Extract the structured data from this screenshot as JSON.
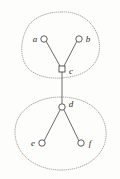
{
  "figure": {
    "type": "graph-diagram",
    "background_color": "#fdfdfc",
    "width": 120,
    "height": 179,
    "edge_color": "#5b5b5b",
    "node_stroke_color": "#4a4a4a",
    "node_fill_color": "#ffffff",
    "blob_stroke_color": "#9a9a9a",
    "label_color": "#2b2b2b"
  },
  "nodes": [
    {
      "id": "a",
      "label": "a",
      "shape": "circle",
      "cx": 44,
      "cy": 39,
      "r": 3.2,
      "label_x": 35,
      "label_y": 39,
      "label_anchor": "middle"
    },
    {
      "id": "b",
      "label": "b",
      "shape": "circle",
      "cx": 79,
      "cy": 39,
      "r": 3.2,
      "label_x": 88,
      "label_y": 39,
      "label_anchor": "middle"
    },
    {
      "id": "c",
      "label": "c",
      "shape": "square",
      "cx": 62,
      "cy": 69,
      "r": 3.0,
      "label_x": 71,
      "label_y": 71,
      "label_anchor": "middle"
    },
    {
      "id": "d",
      "label": "d",
      "shape": "circle",
      "cx": 62,
      "cy": 107,
      "r": 3.2,
      "label_x": 71,
      "label_y": 104,
      "label_anchor": "middle"
    },
    {
      "id": "e",
      "label": "e",
      "shape": "circle",
      "cx": 42,
      "cy": 143,
      "r": 3.2,
      "label_x": 33,
      "label_y": 143,
      "label_anchor": "middle"
    },
    {
      "id": "f",
      "label": "f",
      "shape": "circle",
      "cx": 81,
      "cy": 143,
      "r": 3.2,
      "label_x": 90,
      "label_y": 143,
      "label_anchor": "middle"
    }
  ],
  "edges": [
    {
      "id": "a-c",
      "from": "a",
      "to": "c",
      "x1": 46,
      "y1": 41,
      "x2": 60,
      "y2": 66
    },
    {
      "id": "b-c",
      "from": "b",
      "to": "c",
      "x1": 77,
      "y1": 41,
      "x2": 64,
      "y2": 66
    },
    {
      "id": "c-d",
      "from": "c",
      "to": "d",
      "x1": 62,
      "y1": 72,
      "x2": 62,
      "y2": 104
    },
    {
      "id": "d-e",
      "from": "d",
      "to": "e",
      "x1": 60,
      "y1": 110,
      "x2": 44,
      "y2": 141
    },
    {
      "id": "d-f",
      "from": "d",
      "to": "f",
      "x1": 64,
      "y1": 110,
      "x2": 79,
      "y2": 141
    }
  ],
  "regions": [
    {
      "id": "top-region",
      "name": "upper-dotted-blob",
      "path": "M 62 12 C 80 11, 96 23, 99 41 C 102 58, 92 72, 74 76 C 58 80, 38 79, 28 68 C 19 58, 20 38, 29 25 C 37 15, 50 12, 62 12 Z"
    },
    {
      "id": "bottom-region",
      "name": "lower-dotted-blob",
      "path": "M 61 97 C 83 97, 104 108, 106 131 C 108 153, 88 170, 61 170 C 35 170, 15 154, 15 132 C 15 110, 37 97, 61 97 Z"
    }
  ]
}
